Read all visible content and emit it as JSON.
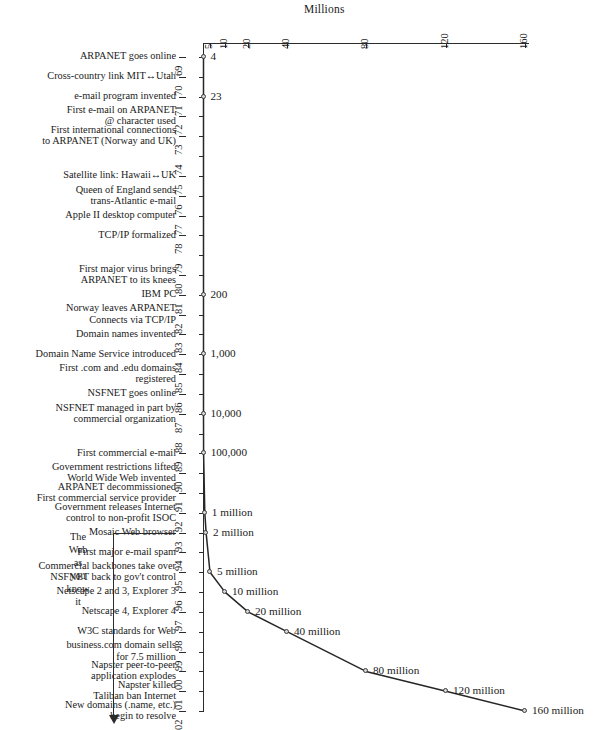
{
  "chart_data": {
    "type": "line",
    "title": "Millions",
    "xlabel": "Millions",
    "ylabel": "",
    "orientation": "years-vertical",
    "axis_note": "Millions",
    "x_ticks": [
      5,
      10,
      20,
      40,
      80,
      120,
      160
    ],
    "x_tick_labels": [
      "5",
      "10",
      "20",
      "40",
      "80",
      "120",
      "160"
    ],
    "year_labels": [
      "69",
      "70",
      "71",
      "72",
      "73",
      "74",
      "75",
      "76",
      "77",
      "78",
      "79",
      "80",
      "81",
      "82",
      "83",
      "84",
      "85",
      "86",
      "87",
      "88",
      "89",
      "90",
      "91",
      "92",
      "93",
      "94",
      "95",
      "96",
      "97",
      "98",
      "99",
      "00",
      "01",
      "02"
    ],
    "points": [
      {
        "year": "69",
        "value": 4,
        "label": "4"
      },
      {
        "year": "71",
        "value": 23,
        "label": "23"
      },
      {
        "year": "81",
        "value": 200,
        "label": "200"
      },
      {
        "year": "84",
        "value": 1000,
        "label": "1,000"
      },
      {
        "year": "87",
        "value": 10000,
        "label": "10,000"
      },
      {
        "year": "89",
        "value": 100000,
        "label": "100,000"
      },
      {
        "year": "92",
        "value": 1000000,
        "label": "1 million"
      },
      {
        "year": "93",
        "value": 2000000,
        "label": "2 million"
      },
      {
        "year": "95",
        "value": 5000000,
        "label": "5 million"
      },
      {
        "year": "96",
        "value": 10000000,
        "label": "10 million"
      },
      {
        "year": "97",
        "value": 20000000,
        "label": "20 million"
      },
      {
        "year": "98",
        "value": 40000000,
        "label": "40 million"
      },
      {
        "year": "00",
        "value": 80000000,
        "label": "80 million"
      },
      {
        "year": "01",
        "value": 120000000,
        "label": "120 million"
      },
      {
        "year": "02",
        "value": 160000000,
        "label": "160 million"
      }
    ],
    "events": [
      {
        "year": "69",
        "text": "ARPANET goes online"
      },
      {
        "year": "70",
        "text": "Cross-country link MIT↔Utah"
      },
      {
        "year": "71",
        "text": "e-mail program invented"
      },
      {
        "year": "72",
        "text": "First e-mail on ARPANET\n@ character used"
      },
      {
        "year": "73",
        "text": "First international connections\nto ARPANET (Norway and UK)"
      },
      {
        "year": "75",
        "text": "Satellite link: Hawaii↔UK"
      },
      {
        "year": "76",
        "text": "Queen of England sends\ntrans-Atlantic e-mail"
      },
      {
        "year": "77",
        "text": "Apple II desktop computer"
      },
      {
        "year": "78",
        "text": "TCP/IP formalized"
      },
      {
        "year": "80",
        "text": "First major virus brings\nARPANET to its knees"
      },
      {
        "year": "81",
        "text": "IBM PC"
      },
      {
        "year": "82",
        "text": "Norway leaves ARPANET\nConnects via TCP/IP"
      },
      {
        "year": "83",
        "text": "Domain names invented"
      },
      {
        "year": "84",
        "text": "Domain Name Service introduced"
      },
      {
        "year": "85",
        "text": "First .com and .edu domains\nregistered"
      },
      {
        "year": "86",
        "text": "NSFNET goes online"
      },
      {
        "year": "87",
        "text": "NSFNET managed in part by\ncommercial organization"
      },
      {
        "year": "89",
        "text": "First commercial e-mail"
      },
      {
        "year": "90",
        "text": "Government restrictions lifted\nWorld Wide Web invented"
      },
      {
        "year": "91",
        "text": "ARPANET decommissioned\nFirst commercial service provider"
      },
      {
        "year": "92",
        "text": "Government releases Internet\ncontrol to non-profit ISOC"
      },
      {
        "year": "93",
        "text": "Mosaic Web browser"
      },
      {
        "year": "94",
        "text": "First major e-mail spam"
      },
      {
        "year": "95",
        "text": "Commercial backbones take over\nNSFNET back to gov't control"
      },
      {
        "year": "96",
        "text": "Netscape 2 and 3, Explorer 3"
      },
      {
        "year": "97",
        "text": "Netscape 4, Explorer 4"
      },
      {
        "year": "98",
        "text": "W3C standards for Web"
      },
      {
        "year": "99",
        "text": "business.com domain sells\nfor 7.5 million"
      },
      {
        "year": "00",
        "text": "Napster peer-to-peer\napplication explodes"
      },
      {
        "year": "01",
        "text": "Napster killed\nTaliban ban Internet"
      },
      {
        "year": "02",
        "text": "New domains (.name, etc.)\nbegin to resolve"
      }
    ],
    "bracket": {
      "text": "The\nWeb\nas\nyou\nknow\nit",
      "from_year": "93",
      "to_year": "02"
    }
  }
}
